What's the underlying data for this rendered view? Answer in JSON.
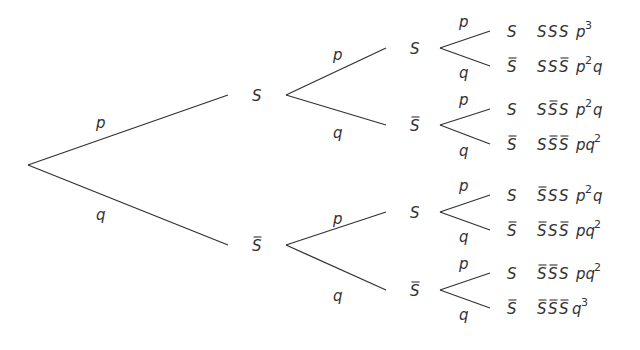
{
  "diagram": {
    "type": "probability-tree",
    "branch_labels": {
      "success": "p",
      "failure": "q"
    },
    "outcome_symbols": {
      "success": "S",
      "failure": "S̄"
    },
    "level1": [
      {
        "node": "S",
        "negated": false,
        "branch": "p"
      },
      {
        "node": "S",
        "negated": true,
        "branch": "q"
      }
    ],
    "level2": [
      {
        "node": "S",
        "negated": false,
        "branch": "p"
      },
      {
        "node": "S",
        "negated": true,
        "branch": "q"
      },
      {
        "node": "S",
        "negated": false,
        "branch": "p"
      },
      {
        "node": "S",
        "negated": true,
        "branch": "q"
      }
    ],
    "leaves": [
      {
        "node": "S",
        "negated": false,
        "branch": "p",
        "sequence": [
          "S",
          "S",
          "S"
        ],
        "seq_negated": [
          false,
          false,
          false
        ],
        "prob_base": "p",
        "prob_exp": "3",
        "prob_tail": ""
      },
      {
        "node": "S",
        "negated": true,
        "branch": "q",
        "sequence": [
          "S",
          "S",
          "S"
        ],
        "seq_negated": [
          false,
          false,
          true
        ],
        "prob_base": "p",
        "prob_exp": "2",
        "prob_tail": "q"
      },
      {
        "node": "S",
        "negated": false,
        "branch": "p",
        "sequence": [
          "S",
          "S",
          "S"
        ],
        "seq_negated": [
          false,
          true,
          false
        ],
        "prob_base": "p",
        "prob_exp": "2",
        "prob_tail": "q"
      },
      {
        "node": "S",
        "negated": true,
        "branch": "q",
        "sequence": [
          "S",
          "S",
          "S"
        ],
        "seq_negated": [
          false,
          true,
          true
        ],
        "prob_base": "pq",
        "prob_exp": "2",
        "prob_tail": ""
      },
      {
        "node": "S",
        "negated": false,
        "branch": "p",
        "sequence": [
          "S",
          "S",
          "S"
        ],
        "seq_negated": [
          true,
          false,
          false
        ],
        "prob_base": "p",
        "prob_exp": "2",
        "prob_tail": "q"
      },
      {
        "node": "S",
        "negated": true,
        "branch": "q",
        "sequence": [
          "S",
          "S",
          "S"
        ],
        "seq_negated": [
          true,
          false,
          true
        ],
        "prob_base": "pq",
        "prob_exp": "2",
        "prob_tail": ""
      },
      {
        "node": "S",
        "negated": false,
        "branch": "p",
        "sequence": [
          "S",
          "S",
          "S"
        ],
        "seq_negated": [
          true,
          true,
          false
        ],
        "prob_base": "pq",
        "prob_exp": "2",
        "prob_tail": ""
      },
      {
        "node": "S",
        "negated": true,
        "branch": "q",
        "sequence": [
          "S",
          "S",
          "S"
        ],
        "seq_negated": [
          true,
          true,
          true
        ],
        "prob_base": "q",
        "prob_exp": "3",
        "prob_tail": ""
      }
    ]
  }
}
